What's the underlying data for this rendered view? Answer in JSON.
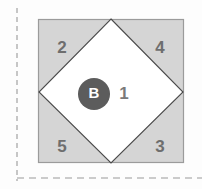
{
  "figure": {
    "canvas": {
      "width": 202,
      "height": 189,
      "background": "#fdfdfd"
    },
    "axes": {
      "vertical_dashed_line": {
        "name": "vertical-axis-dashed",
        "x": 17,
        "y_start": 8,
        "y_end": 181,
        "color": "#9a9a9a",
        "dash": "5 4"
      },
      "horizontal_dashed_line": {
        "name": "horizontal-axis-dashed",
        "y": 178,
        "x_start": 17,
        "x_end": 202,
        "color": "#9a9a9a",
        "dash": "7 5"
      }
    },
    "outer_square": {
      "x": 38,
      "y": 19,
      "width": 146,
      "height": 144,
      "fill": "#d5d5d5",
      "stroke": "#9b9b9b",
      "stroke_width": 1.2
    },
    "inner_diamond": {
      "points": "111,19 183,92 111,163 39,92",
      "fill": "#ffffff",
      "stroke": "#4a4a4a",
      "stroke_width": 1.1
    },
    "center_node": {
      "label": "B",
      "cx": 94,
      "cy": 94,
      "r": 16,
      "fill": "#5c5c5c",
      "text_color": "#ffffff"
    },
    "inner_region": {
      "label": "1",
      "x": 124,
      "y": 100,
      "color": "#7a7a7a"
    },
    "corner_regions": [
      {
        "label": "2",
        "position": "top-left",
        "x": 62,
        "y": 49
      },
      {
        "label": "4",
        "position": "top-right",
        "x": 160,
        "y": 49
      },
      {
        "label": "5",
        "position": "bottom-left",
        "x": 62,
        "y": 148
      },
      {
        "label": "3",
        "position": "bottom-right",
        "x": 160,
        "y": 148
      }
    ],
    "colors": {
      "square_fill": "#d5d5d5",
      "diamond_fill": "#ffffff",
      "node_fill": "#5c5c5c",
      "label_gray": "#6e6e6e",
      "dash_gray": "#9a9a9a"
    }
  }
}
